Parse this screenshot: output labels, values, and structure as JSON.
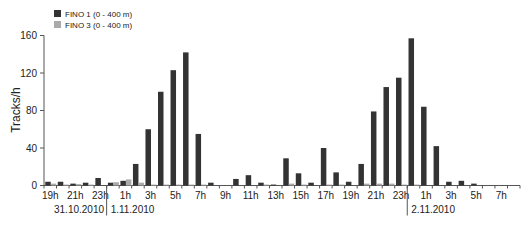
{
  "chart_data": {
    "type": "bar",
    "title": "",
    "xlabel": "",
    "ylabel": "Tracks/h",
    "ylim": [
      0,
      160
    ],
    "yticks": [
      0,
      40,
      80,
      120,
      160
    ],
    "grid": false,
    "legend_position": "top-left",
    "categories": [
      "19h",
      "20h",
      "21h",
      "22h",
      "23h",
      "0h",
      "1h",
      "2h",
      "3h",
      "4h",
      "5h",
      "6h",
      "7h",
      "8h",
      "9h",
      "10h",
      "11h",
      "12h",
      "13h",
      "14h",
      "15h",
      "16h",
      "17h",
      "18h",
      "19h",
      "20h",
      "21h",
      "22h",
      "23h",
      "0h",
      "1h",
      "2h",
      "3h",
      "4h",
      "5h",
      "6h",
      "7h",
      "8h"
    ],
    "x_tick_labels": [
      "19h",
      "21h",
      "23h",
      "1h",
      "3h",
      "5h",
      "7h",
      "9h",
      "11h",
      "13h",
      "15h",
      "17h",
      "19h",
      "21h",
      "23h",
      "1h",
      "3h",
      "5h",
      "7h"
    ],
    "x_tick_label_category_index": [
      0,
      2,
      4,
      6,
      8,
      10,
      12,
      14,
      16,
      18,
      20,
      22,
      24,
      26,
      28,
      30,
      32,
      34,
      36
    ],
    "date_groups": [
      {
        "label": "31.10.2010",
        "start_index": 0
      },
      {
        "label": "1.11.2010",
        "start_index": 5
      },
      {
        "label": "2.11.2010",
        "start_index": 29
      }
    ],
    "series": [
      {
        "name": "FINO 1 (0 - 400 m)",
        "color": "#333333",
        "values": [
          4,
          4,
          2,
          3,
          8,
          3,
          5,
          23,
          60,
          100,
          123,
          142,
          55,
          3,
          0,
          7,
          11,
          3,
          1,
          29,
          13,
          3,
          40,
          14,
          4,
          23,
          79,
          105,
          115,
          157,
          84,
          42,
          4,
          5,
          2,
          0,
          0,
          0
        ]
      },
      {
        "name": "FINO 3 (0 - 400 m)",
        "color": "#aaaaaa",
        "values": [
          2,
          1,
          1.5,
          1,
          0,
          3.5,
          6.5,
          3,
          1,
          1,
          1,
          1,
          1,
          0,
          0,
          0,
          0,
          1,
          0,
          2,
          1,
          0,
          1,
          1,
          0,
          2,
          2,
          2,
          1,
          1,
          0,
          0,
          0,
          0,
          0,
          0,
          0,
          0
        ]
      }
    ]
  }
}
